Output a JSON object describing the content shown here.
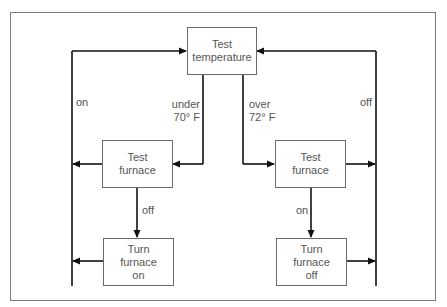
{
  "diagram": {
    "type": "flowchart",
    "nodes": [
      {
        "id": "test_temperature",
        "label": "Test\ntemperature"
      },
      {
        "id": "test_furnace_left",
        "label": "Test\nfurnace"
      },
      {
        "id": "test_furnace_right",
        "label": "Test\nfurnace"
      },
      {
        "id": "turn_furnace_on",
        "label": "Turn\nfurnace\non"
      },
      {
        "id": "turn_furnace_off",
        "label": "Turn\nfurnace\noff"
      }
    ],
    "edge_labels": {
      "under": "under\n70° F",
      "over": "over\n72° F",
      "left_on": "on",
      "left_off": "off",
      "right_on": "on",
      "right_off": "off"
    },
    "edges": [
      {
        "from": "test_temperature",
        "to": "test_furnace_left",
        "label": "under 70° F"
      },
      {
        "from": "test_temperature",
        "to": "test_furnace_right",
        "label": "over 72° F"
      },
      {
        "from": "test_furnace_left",
        "to": "turn_furnace_on",
        "label": "off"
      },
      {
        "from": "test_furnace_left",
        "to": "test_temperature",
        "label": "on"
      },
      {
        "from": "turn_furnace_on",
        "to": "test_temperature",
        "label": ""
      },
      {
        "from": "test_furnace_right",
        "to": "turn_furnace_off",
        "label": "on"
      },
      {
        "from": "test_furnace_right",
        "to": "test_temperature",
        "label": "off"
      },
      {
        "from": "turn_furnace_off",
        "to": "test_temperature",
        "label": ""
      }
    ]
  }
}
